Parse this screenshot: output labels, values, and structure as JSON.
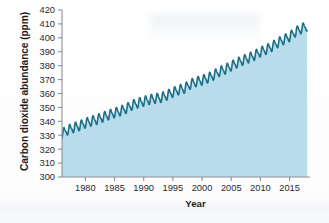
{
  "chart_data": {
    "type": "area",
    "title": "",
    "xlabel": "Year",
    "ylabel": "Carbon dioxide abundance (ppm)",
    "xlim": [
      1976,
      2018.5
    ],
    "ylim": [
      300,
      420
    ],
    "xticks": [
      1980,
      1985,
      1990,
      1995,
      2000,
      2005,
      2010,
      2015
    ],
    "xtick_labels": [
      "1980",
      "1985",
      "1990",
      "1995",
      "2000",
      "2005",
      "2010",
      "2015"
    ],
    "yticks": [
      300,
      310,
      320,
      330,
      340,
      350,
      360,
      370,
      380,
      390,
      400,
      410,
      420
    ],
    "ytick_labels": [
      "300",
      "310",
      "320",
      "330",
      "340",
      "350",
      "360",
      "370",
      "380",
      "390",
      "400",
      "410",
      "420"
    ],
    "grid": false,
    "legend": "none",
    "line_color": "#1b6f86",
    "fill_color": "#b9dcec",
    "axis_color": "#8a9199",
    "series": [
      {
        "name": "Annual mean CO2",
        "note": "Annual-mean trend; actual plotted curve adds a seasonal oscillation of about +/- 3 ppm per year",
        "seasonal_amplitude_ppm": 3.1,
        "x": [
          1976,
          1977,
          1978,
          1979,
          1980,
          1981,
          1982,
          1983,
          1984,
          1985,
          1986,
          1987,
          1988,
          1989,
          1990,
          1991,
          1992,
          1993,
          1994,
          1995,
          1996,
          1997,
          1998,
          1999,
          2000,
          2001,
          2002,
          2003,
          2004,
          2005,
          2006,
          2007,
          2008,
          2009,
          2010,
          2011,
          2012,
          2013,
          2014,
          2015,
          2016,
          2017,
          2018
        ],
        "values": [
          331.1,
          333.8,
          335.4,
          336.8,
          338.7,
          340.1,
          341.4,
          343.0,
          344.6,
          346.0,
          347.4,
          349.2,
          351.6,
          353.1,
          354.4,
          355.6,
          356.4,
          357.1,
          358.8,
          360.8,
          362.6,
          363.7,
          366.7,
          368.4,
          369.6,
          371.1,
          373.2,
          375.8,
          377.5,
          379.8,
          381.9,
          383.8,
          385.6,
          387.4,
          389.9,
          391.6,
          393.8,
          396.5,
          398.6,
          400.8,
          404.2,
          406.5,
          408.5
        ]
      }
    ]
  }
}
